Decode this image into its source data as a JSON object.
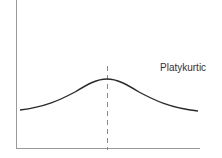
{
  "diagram": {
    "type": "distribution-curve",
    "label": "Platykurtic",
    "colors": {
      "curve": "#2a2a2a",
      "axes": "#9a9a9a",
      "mean_line": "#8a8a8a",
      "label": "#333333"
    }
  }
}
